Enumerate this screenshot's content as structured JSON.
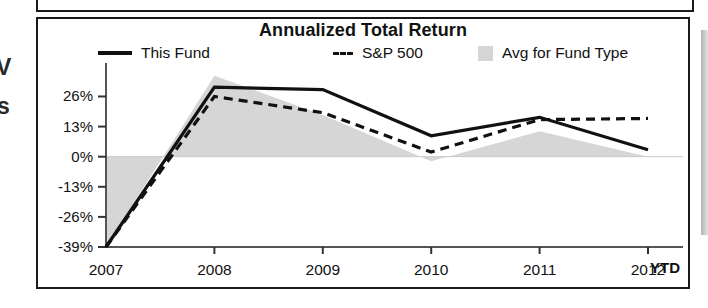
{
  "chart_data": {
    "type": "line",
    "title": "Annualized Total Return",
    "xlabel": "",
    "ylabel": "",
    "categories": [
      "2007",
      "2008",
      "2009",
      "2010",
      "2011",
      "2012"
    ],
    "x_axis_suffix": "YTD",
    "ytick_labels": [
      "26%",
      "13%",
      "0%",
      "-13%",
      "-26%",
      "-39%"
    ],
    "ytick_values": [
      26,
      13,
      0,
      -13,
      -26,
      -39
    ],
    "ylim": [
      -39,
      37
    ],
    "grid": false,
    "legend_position": "top",
    "series": [
      {
        "name": "This Fund",
        "style": "solid",
        "color": "#111111",
        "values": [
          -39,
          30,
          29,
          9,
          17,
          3
        ]
      },
      {
        "name": "S&P 500",
        "style": "dashed",
        "color": "#111111",
        "values": [
          -39,
          26,
          19,
          2,
          16,
          16.5
        ]
      },
      {
        "name": "Avg for Fund Type",
        "style": "area",
        "color": "#d6d6d6",
        "values": [
          -39,
          35,
          18,
          -2,
          11,
          0
        ]
      }
    ]
  },
  "chart": {
    "title": "Annualized Total Return",
    "ytd_label": "YTD"
  },
  "legend": {
    "items": [
      {
        "label": "This Fund",
        "marker": "solid-line-swatch"
      },
      {
        "label": "S&P 500",
        "marker": "dashed-line-swatch"
      },
      {
        "label": "Avg for Fund Type",
        "marker": "gray-area-swatch"
      }
    ]
  },
  "artifacts": {
    "edge_glyph_1": "V",
    "edge_glyph_2": "s"
  }
}
